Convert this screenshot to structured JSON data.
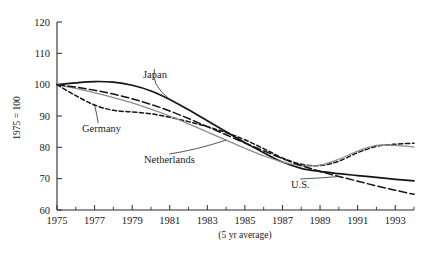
{
  "chart_data": {
    "type": "line",
    "title": "",
    "xlabel": "(5 yr average)",
    "ylabel": "1975 = 100",
    "xlim": [
      1975,
      1994
    ],
    "ylim": [
      60,
      120
    ],
    "grid": false,
    "legend_position": "inline-annotations",
    "ytick_labels": [
      "120",
      "110",
      "100",
      "90",
      "80",
      "70",
      "60"
    ],
    "ytick_values": [
      120,
      110,
      100,
      90,
      80,
      70,
      60
    ],
    "xtick_labels": [
      "1975",
      "1977",
      "1979",
      "1981",
      "1983",
      "1985",
      "1987",
      "1989",
      "1991",
      "1993"
    ],
    "xtick_values": [
      1975,
      1977,
      1979,
      1981,
      1983,
      1985,
      1987,
      1989,
      1991,
      1993
    ],
    "x": [
      1975,
      1976,
      1977,
      1978,
      1979,
      1980,
      1981,
      1982,
      1983,
      1984,
      1985,
      1986,
      1987,
      1988,
      1989,
      1990,
      1991,
      1992,
      1993,
      1994
    ],
    "series": [
      {
        "name": "Japan",
        "style": "solid",
        "color": "#141414",
        "width": 1.7,
        "values": [
          100.0,
          100.6,
          101.0,
          100.8,
          99.8,
          98.0,
          95.3,
          92.0,
          88.5,
          85.0,
          81.5,
          78.3,
          75.3,
          73.3,
          72.3,
          71.6,
          71.0,
          70.4,
          69.8,
          69.3
        ]
      },
      {
        "name": "Germany",
        "style": "dashed-short",
        "color": "#141414",
        "width": 1.5,
        "values": [
          100.0,
          96.5,
          93.5,
          91.8,
          91.3,
          90.7,
          89.6,
          88.2,
          86.6,
          84.7,
          82.4,
          79.6,
          76.6,
          74.6,
          74.2,
          75.6,
          78.3,
          80.3,
          81.0,
          81.3
        ]
      },
      {
        "name": "Netherlands",
        "style": "solid",
        "color": "#8c8c8c",
        "width": 1.3,
        "values": [
          100.0,
          98.8,
          97.4,
          95.9,
          94.2,
          92.2,
          90.0,
          87.5,
          84.9,
          82.3,
          79.7,
          77.3,
          75.3,
          74.2,
          74.3,
          76.2,
          78.8,
          80.6,
          80.6,
          80.1
        ]
      },
      {
        "name": "U.S.",
        "style": "dashed-long",
        "color": "#141414",
        "width": 1.5,
        "values": [
          100.0,
          99.2,
          98.2,
          97.0,
          95.5,
          93.7,
          91.6,
          89.2,
          86.6,
          84.0,
          81.4,
          78.9,
          76.4,
          74.2,
          72.3,
          70.7,
          69.2,
          67.7,
          66.3,
          65.0
        ]
      }
    ],
    "annotations": [
      {
        "text": "Japan",
        "series": "Japan"
      },
      {
        "text": "Germany",
        "series": "Germany"
      },
      {
        "text": "Netherlands",
        "series": "Netherlands"
      },
      {
        "text": "U.S.",
        "series": "U.S."
      }
    ]
  }
}
